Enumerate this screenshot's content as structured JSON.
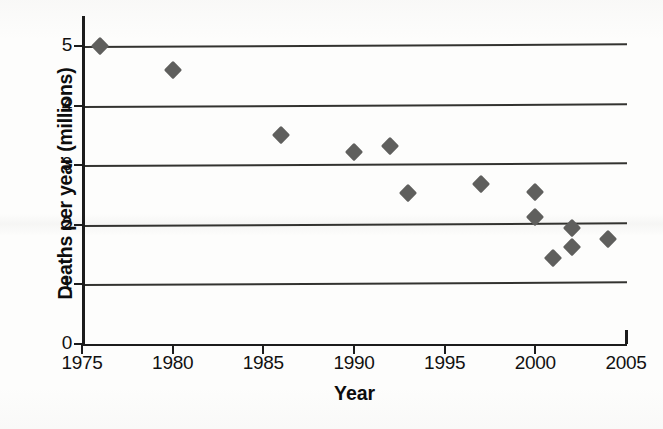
{
  "chart_data": {
    "type": "scatter",
    "title": "",
    "xlabel": "Year",
    "ylabel": "Deaths per year (millions)",
    "xlim": [
      1975,
      2005
    ],
    "ylim": [
      0,
      5
    ],
    "xticks": [
      1975,
      1980,
      1985,
      1990,
      1995,
      2000,
      2005
    ],
    "yticks": [
      0,
      1,
      2,
      3,
      4,
      5
    ],
    "xtick_labels": [
      "1975",
      "1980",
      "1985",
      "1990",
      "1995",
      "2000",
      "2005"
    ],
    "ytick_labels": [
      "0",
      "1",
      "2",
      "3",
      "4",
      "5"
    ],
    "grid": "horizontal",
    "gridlines_at": [
      1,
      2,
      3,
      4,
      5
    ],
    "legend": "none",
    "marker_shape": "diamond",
    "marker_color": "#5f5f5d",
    "series": [
      {
        "name": "Deaths per year",
        "points": [
          {
            "x": 1976,
            "y": 5.0
          },
          {
            "x": 1980,
            "y": 4.6
          },
          {
            "x": 1986,
            "y": 3.5
          },
          {
            "x": 1990,
            "y": 3.22
          },
          {
            "x": 1992,
            "y": 3.32
          },
          {
            "x": 1993,
            "y": 2.53
          },
          {
            "x": 1997,
            "y": 2.68
          },
          {
            "x": 2000,
            "y": 2.55
          },
          {
            "x": 2000,
            "y": 2.13
          },
          {
            "x": 2001,
            "y": 1.44
          },
          {
            "x": 2002,
            "y": 1.95
          },
          {
            "x": 2002,
            "y": 1.63
          },
          {
            "x": 2004,
            "y": 1.77
          }
        ]
      }
    ]
  },
  "axis": {
    "x_title": "Year",
    "y_title": "Deaths per year (millions)"
  }
}
